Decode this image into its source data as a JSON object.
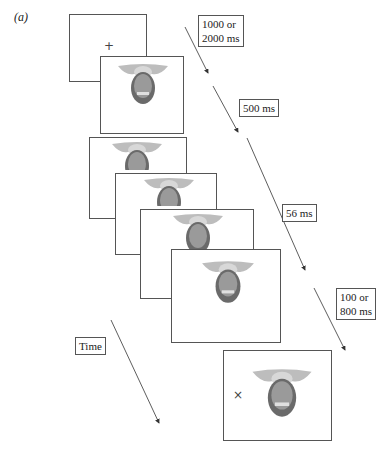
{
  "figure": {
    "panel_label": "(a)",
    "fixation_symbol": "+",
    "response_symbol": "×",
    "timing_labels": {
      "fixation": [
        "1000 or",
        "2000 ms"
      ],
      "face": [
        "500 ms"
      ],
      "morph": [
        "56 ms"
      ],
      "final": [
        "100 or",
        "800 ms"
      ]
    },
    "time_label": "Time",
    "frames": [
      {
        "id": "fixation",
        "content": "fixation-cross"
      },
      {
        "id": "face-1",
        "content": "inverted-face"
      },
      {
        "id": "stack-1",
        "content": "inverted-face-partial"
      },
      {
        "id": "stack-2",
        "content": "inverted-face-partial"
      },
      {
        "id": "stack-3",
        "content": "inverted-face-partial"
      },
      {
        "id": "stack-4",
        "content": "inverted-face"
      },
      {
        "id": "final",
        "content": "inverted-face-with-cross"
      }
    ],
    "colors": {
      "border": "#555555",
      "arrow": "#333333",
      "background": "#ffffff"
    }
  }
}
